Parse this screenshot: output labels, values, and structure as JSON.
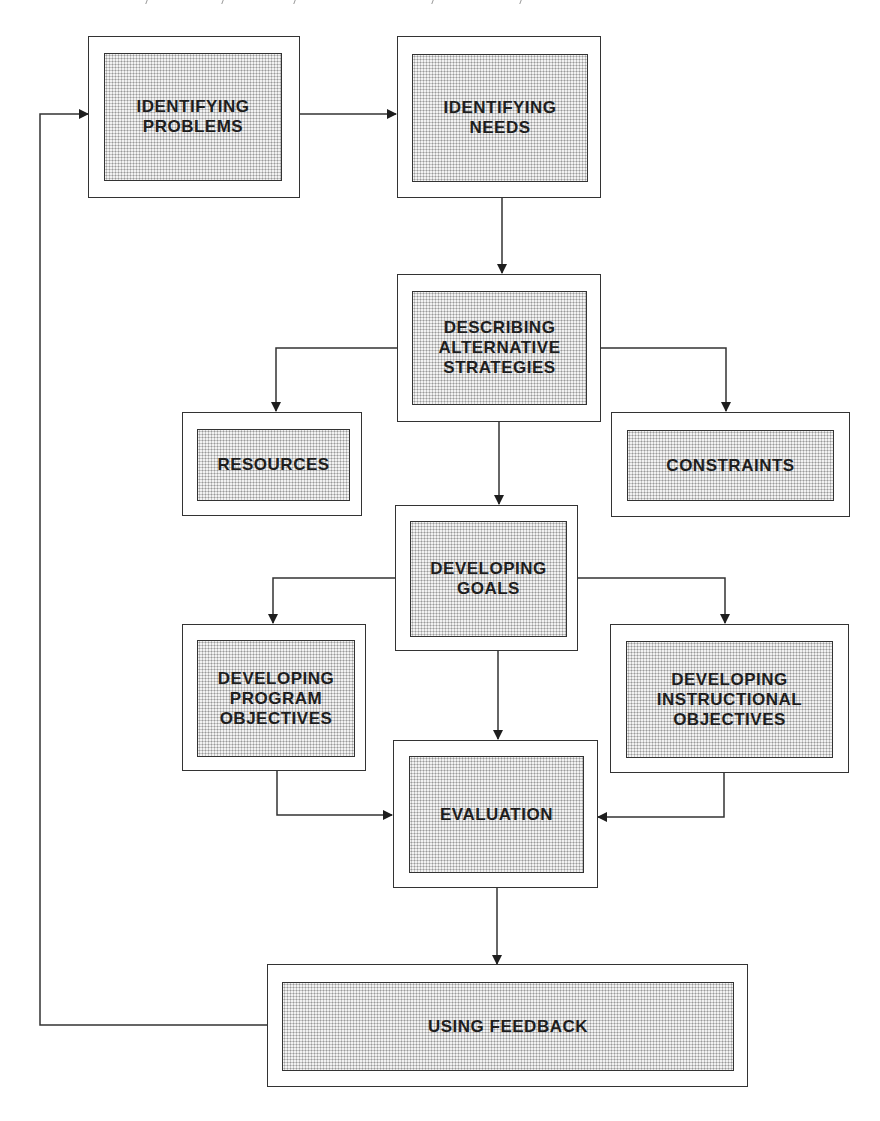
{
  "diagram": {
    "type": "flowchart",
    "nodes": [
      {
        "id": "identifying-problems",
        "label": "IDENTIFYING\nPROBLEMS"
      },
      {
        "id": "identifying-needs",
        "label": "IDENTIFYING\nNEEDS"
      },
      {
        "id": "describing-alternative-strategies",
        "label": "DESCRIBING\nALTERNATIVE\nSTRATEGIES"
      },
      {
        "id": "resources",
        "label": "RESOURCES"
      },
      {
        "id": "constraints",
        "label": "CONSTRAINTS"
      },
      {
        "id": "developing-goals",
        "label": "DEVELOPING\nGOALS"
      },
      {
        "id": "developing-program-objectives",
        "label": "DEVELOPING\nPROGRAM\nOBJECTIVES"
      },
      {
        "id": "developing-instructional-objectives",
        "label": "DEVELOPING\nINSTRUCTIONAL\nOBJECTIVES"
      },
      {
        "id": "evaluation",
        "label": "EVALUATION"
      },
      {
        "id": "using-feedback",
        "label": "USING FEEDBACK"
      }
    ],
    "edges": [
      {
        "from": "identifying-problems",
        "to": "identifying-needs"
      },
      {
        "from": "identifying-needs",
        "to": "describing-alternative-strategies"
      },
      {
        "from": "describing-alternative-strategies",
        "to": "resources"
      },
      {
        "from": "describing-alternative-strategies",
        "to": "constraints"
      },
      {
        "from": "describing-alternative-strategies",
        "to": "developing-goals"
      },
      {
        "from": "developing-goals",
        "to": "developing-program-objectives"
      },
      {
        "from": "developing-goals",
        "to": "developing-instructional-objectives"
      },
      {
        "from": "developing-goals",
        "to": "evaluation"
      },
      {
        "from": "developing-program-objectives",
        "to": "evaluation"
      },
      {
        "from": "developing-instructional-objectives",
        "to": "evaluation"
      },
      {
        "from": "evaluation",
        "to": "using-feedback"
      },
      {
        "from": "using-feedback",
        "to": "identifying-problems"
      }
    ]
  }
}
